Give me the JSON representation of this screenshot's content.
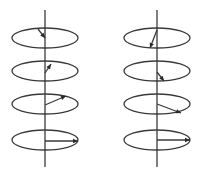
{
  "diagram": {
    "stroke_color": "#3a3a3a",
    "background": "#ffffff",
    "figures": [
      {
        "name": "left-stack",
        "axis": {
          "x": 45,
          "y1": 10,
          "y2": 167
        },
        "loops": [
          {
            "cx": 45,
            "cy": 38,
            "rx": 33,
            "ry": 10,
            "arrow": {
              "x1": 45,
              "y1": 38,
              "x2": 38,
              "y2": 29,
              "head_at": "start"
            }
          },
          {
            "cx": 45,
            "cy": 71,
            "rx": 33,
            "ry": 10,
            "arrow": {
              "x1": 45,
              "y1": 73,
              "x2": 51,
              "y2": 64,
              "head_at": "end"
            }
          },
          {
            "cx": 45,
            "cy": 104,
            "rx": 33,
            "ry": 10,
            "arrow": {
              "x1": 45,
              "y1": 105,
              "x2": 66,
              "y2": 96,
              "head_at": "end"
            }
          },
          {
            "cx": 45,
            "cy": 140,
            "rx": 33,
            "ry": 10,
            "arrow": {
              "x1": 45,
              "y1": 141,
              "x2": 78,
              "y2": 141,
              "head_at": "end"
            }
          }
        ]
      },
      {
        "name": "right-stack",
        "axis": {
          "x": 157,
          "y1": 10,
          "y2": 167
        },
        "loops": [
          {
            "cx": 157,
            "cy": 38,
            "rx": 33,
            "ry": 10,
            "arrow": {
              "x1": 157,
              "y1": 30,
              "x2": 150,
              "y2": 48,
              "head_at": "end"
            }
          },
          {
            "cx": 157,
            "cy": 71,
            "rx": 33,
            "ry": 10,
            "arrow": {
              "x1": 157,
              "y1": 72,
              "x2": 164,
              "y2": 81,
              "head_at": "end"
            }
          },
          {
            "cx": 157,
            "cy": 104,
            "rx": 33,
            "ry": 10,
            "arrow": {
              "x1": 157,
              "y1": 104,
              "x2": 181,
              "y2": 113,
              "head_at": "end"
            }
          },
          {
            "cx": 157,
            "cy": 140,
            "rx": 33,
            "ry": 10,
            "arrow": {
              "x1": 157,
              "y1": 140,
              "x2": 190,
              "y2": 140,
              "head_at": "end"
            }
          }
        ]
      }
    ]
  }
}
